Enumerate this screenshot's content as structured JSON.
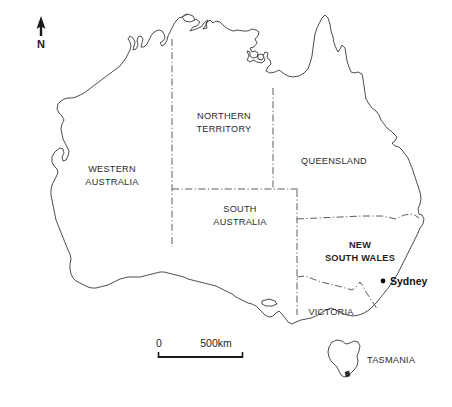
{
  "map": {
    "title": "Australia states map",
    "background_color": "#ffffff",
    "outline_color": "#3a3a3a",
    "border_color": "#4a4a4a",
    "highlight_fill": "#e2e2e2",
    "states": [
      {
        "id": "wa",
        "label_line1": "WESTERN",
        "label_line2": "AUSTRALIA",
        "x": 112,
        "y": 172,
        "highlighted": false
      },
      {
        "id": "nt",
        "label_line1": "NORTHERN",
        "label_line2": "TERRITORY",
        "x": 224,
        "y": 119,
        "highlighted": false
      },
      {
        "id": "qld",
        "label_line1": "QUEENSLAND",
        "label_line2": "",
        "x": 334,
        "y": 161,
        "highlighted": false
      },
      {
        "id": "sa",
        "label_line1": "SOUTH",
        "label_line2": "AUSTRALIA",
        "x": 240,
        "y": 212,
        "highlighted": false
      },
      {
        "id": "nsw",
        "label_line1": "NEW",
        "label_line2": "SOUTH WALES",
        "x": 360,
        "y": 248,
        "highlighted": true
      },
      {
        "id": "vic",
        "label_line1": "VICTORIA",
        "label_line2": "",
        "x": 331,
        "y": 312,
        "highlighted": false
      },
      {
        "id": "tas",
        "label_line1": "TASMANIA",
        "label_line2": "",
        "x": 367,
        "y": 360,
        "highlighted": false
      }
    ],
    "cities": [
      {
        "id": "sydney",
        "label": "Sydney",
        "dot_x": 383,
        "dot_y": 281,
        "label_x": 391,
        "label_y": 285
      }
    ],
    "north_arrow": {
      "label": "N",
      "x": 41,
      "y": 20
    },
    "scale_bar": {
      "start_label": "0",
      "end_label": "500km",
      "x_start": 158,
      "x_end": 243,
      "y": 350
    }
  }
}
